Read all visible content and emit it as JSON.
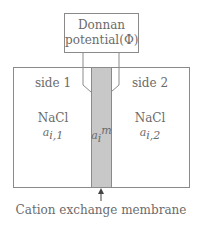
{
  "diagram": {
    "type": "donnan-potential-schematic",
    "potential_box": {
      "line1": "Donnan",
      "line2": "potential(Φ)"
    },
    "side_left": {
      "title": "side 1",
      "species": "NaCl",
      "activity_base": "a",
      "activity_sub": "i,1"
    },
    "membrane": {
      "activity_base": "a",
      "activity_sub": "i",
      "activity_sup": "m",
      "fill_color": "#c8c8c8"
    },
    "side_right": {
      "title": "side 2",
      "species": "NaCl",
      "activity_base": "a",
      "activity_sub": "i,2"
    },
    "caption": "Cation exchange membrane",
    "line_color": "#8a8a8a"
  }
}
